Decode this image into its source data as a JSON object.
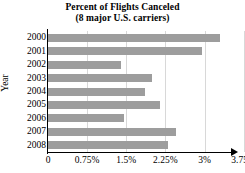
{
  "chart_data": {
    "type": "bar",
    "orientation": "horizontal",
    "title": "Percent of Flights Canceled",
    "subtitle": "(8 major U.S. carriers)",
    "xlabel": "",
    "ylabel": "Year",
    "categories": [
      "2000",
      "2001",
      "2002",
      "2003",
      "2004",
      "2005",
      "2006",
      "2007",
      "2008"
    ],
    "values": [
      3.3,
      2.95,
      1.4,
      2.0,
      1.85,
      2.15,
      1.45,
      2.45,
      2.3
    ],
    "xlim": [
      0,
      3.75
    ],
    "ylim": null,
    "xticks": [
      0,
      0.75,
      1.5,
      2.25,
      3,
      3.75
    ],
    "xticklabels": [
      "0",
      "0.75%",
      "1.5%",
      "2.25%",
      "3%",
      "3.75%"
    ],
    "grid": "vertical",
    "legend": null,
    "bar_color": "#9d9d9d",
    "gridline_color": "#d8d8d8",
    "axis_color": "#000000"
  }
}
